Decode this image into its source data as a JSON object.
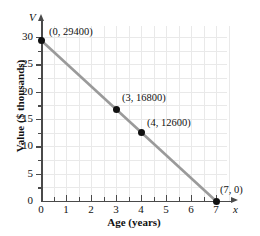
{
  "chart_data": {
    "type": "line",
    "title": "",
    "xlabel": "Age (years)",
    "ylabel": "Value ($ thousands)",
    "x_axis_name": "x",
    "y_axis_name": "V",
    "xlim": [
      0,
      7.5
    ],
    "ylim": [
      0,
      32
    ],
    "grid": true,
    "legend": "none",
    "x_ticks": [
      "0",
      "1",
      "2",
      "3",
      "4",
      "5",
      "6",
      "7"
    ],
    "x_tick_values": [
      0,
      1,
      2,
      3,
      4,
      5,
      6,
      7
    ],
    "y_ticks": [
      "0",
      "5",
      "10",
      "15",
      "20",
      "25",
      "30"
    ],
    "y_tick_values": [
      0,
      5,
      10,
      15,
      20,
      25,
      30
    ],
    "series": [
      {
        "name": "Value vs Age",
        "line_color": "#9a9a9a",
        "point_color": "#111111",
        "x": [
          0,
          3,
          4,
          7
        ],
        "y": [
          29.4,
          16.8,
          12.6,
          0
        ],
        "labels": [
          "(0, 29400)",
          "(3, 16800)",
          "(4, 12600)",
          "(7, 0)"
        ],
        "raw_values": [
          29400,
          16800,
          12600,
          0
        ]
      }
    ],
    "annotations": [
      {
        "text": "(0, 29400)",
        "x": 0,
        "y": 29400
      },
      {
        "text": "(3, 16800)",
        "x": 3,
        "y": 16800
      },
      {
        "text": "(4, 12600)",
        "x": 4,
        "y": 12600
      },
      {
        "text": "(7, 0)",
        "x": 7,
        "y": 0
      }
    ]
  },
  "axis_titles": {
    "x": "Age (years)",
    "y": "Value ($ thousands)",
    "x_symbol": "x",
    "y_symbol": "V"
  },
  "point_labels": {
    "p0": "(0, 29400)",
    "p1": "(3, 16800)",
    "p2": "(4, 12600)",
    "p3": "(7, 0)"
  },
  "colors": {
    "line": "#9a9a9a",
    "point": "#111111",
    "axis": "#4a4a4a",
    "grid": "#e9e9e9",
    "background": "#ffffff"
  }
}
